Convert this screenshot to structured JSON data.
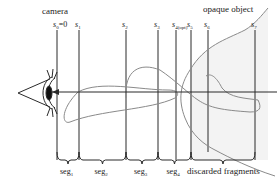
{
  "diagram": {
    "camera_label": "camera",
    "object_label": "opaque object",
    "samples": [
      {
        "base": "s",
        "sub": "0",
        "suffix": "=0"
      },
      {
        "base": "s",
        "sub": "1",
        "suffix": ""
      },
      {
        "base": "s",
        "sub": "2",
        "suffix": ""
      },
      {
        "base": "s",
        "sub": "3",
        "suffix": ""
      },
      {
        "base": "s",
        "sub": "4(opt)",
        "suffix": ""
      },
      {
        "base": "s",
        "sub": "5",
        "suffix": ""
      },
      {
        "base": "s",
        "sub": "6",
        "suffix": ""
      },
      {
        "base": "s",
        "sub": "7",
        "suffix": ""
      }
    ],
    "segments": [
      {
        "base": "seg",
        "sub": "1"
      },
      {
        "base": "seg",
        "sub": "2"
      },
      {
        "base": "seg",
        "sub": "3"
      },
      {
        "base": "seg",
        "sub": "4"
      }
    ],
    "discarded_label": "discarded fragments",
    "colors": {
      "line": "#2a2a2a",
      "curve": "#8a8a8a",
      "shade": "#f2f2f2"
    }
  }
}
